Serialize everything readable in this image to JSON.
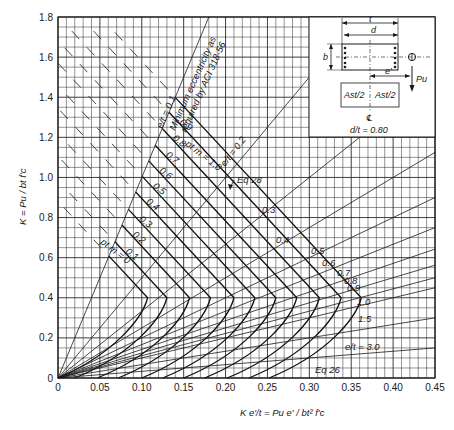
{
  "chart_data": {
    "type": "line",
    "xlabel": "K e'/t = P_u e' / (b t^2 f'_c)",
    "ylabel": "K = P_u / (b t f'_c)",
    "xlim": [
      0,
      0.45
    ],
    "ylim": [
      0,
      1.8
    ],
    "x_ticks": [
      "0",
      "0.05",
      "0.10",
      "0.15",
      "0.20",
      "0.25",
      "0.30",
      "0.35",
      "0.40",
      "0.45"
    ],
    "y_ticks": [
      "0",
      "0.2",
      "0.4",
      "0.6",
      "0.8",
      "1.0",
      "1.2",
      "1.4",
      "1.6",
      "1.8"
    ],
    "grid": true,
    "grid_minor_x": 0.01,
    "grid_minor_y": 0.05,
    "ptm_series": [
      {
        "name": "p_t m = 0",
        "nose": [
          0.107,
          0.4
        ]
      },
      {
        "name": "p_t m = 0.1",
        "nose": [
          0.13,
          0.4
        ]
      },
      {
        "name": "p_t m = 0.2",
        "nose": [
          0.157,
          0.4
        ]
      },
      {
        "name": "p_t m = 0.3",
        "nose": [
          0.182,
          0.4
        ]
      },
      {
        "name": "p_t m = 0.4",
        "nose": [
          0.21,
          0.4
        ]
      },
      {
        "name": "p_t m = 0.5",
        "nose": [
          0.235,
          0.4
        ]
      },
      {
        "name": "p_t m = 0.6",
        "nose": [
          0.26,
          0.4
        ]
      },
      {
        "name": "p_t m = 0.7",
        "nose": [
          0.285,
          0.4
        ]
      },
      {
        "name": "p_t m = 0.8",
        "nose": [
          0.312,
          0.4
        ]
      },
      {
        "name": "p_t m = 0.9",
        "nose": [
          0.338,
          0.4
        ]
      },
      {
        "name": "p_t m = 1.0",
        "nose": [
          0.362,
          0.4
        ]
      }
    ],
    "compression_slope": -4.5,
    "et_lines": [
      0.1,
      0.2,
      0.3,
      0.4,
      0.5,
      0.6,
      0.7,
      0.8,
      0.9,
      1.0,
      1.5,
      3.0
    ],
    "annotations": [
      "e/t = 0.1",
      "Minimum eccentricity as required by ACI 318-56",
      "e/t = 0.2",
      "Eq 28",
      "Eq 26",
      "e/t = 3.0",
      "d/t = 0.80"
    ]
  },
  "labels": {
    "y_axis": "K = Pu / bt f'c",
    "x_axis": "K e'/t = Pu e' / bt² f'c",
    "min_ecc": "Minimum eccentricity as",
    "min_ecc2": "required by ACI 318-56",
    "et01": "e/t = 0.1",
    "et02": "e/t = 0.2",
    "eq28": "Eq 28",
    "eq26": "Eq 26",
    "et30": "e/t = 3.0",
    "ptm0": "pt m = 0",
    "ptm10": "pt m = 1.0",
    "ptm_labels": [
      "0.1",
      "0.2",
      "0.3",
      "0.4",
      "0.5",
      "0.6",
      "0.7",
      "0.8",
      "0.9"
    ],
    "et_right_labels": [
      "0.3",
      "0.4",
      "0.5",
      "0.6",
      "0.7",
      "0.8",
      "0.9",
      "1.0",
      "1.5"
    ]
  },
  "inset": {
    "t": "t",
    "d": "d",
    "b": "b",
    "e_prime": "e'",
    "pu": "Pu",
    "ast_half": "Ast/2",
    "cl": "℄",
    "ratio": "d/t = 0.80"
  }
}
